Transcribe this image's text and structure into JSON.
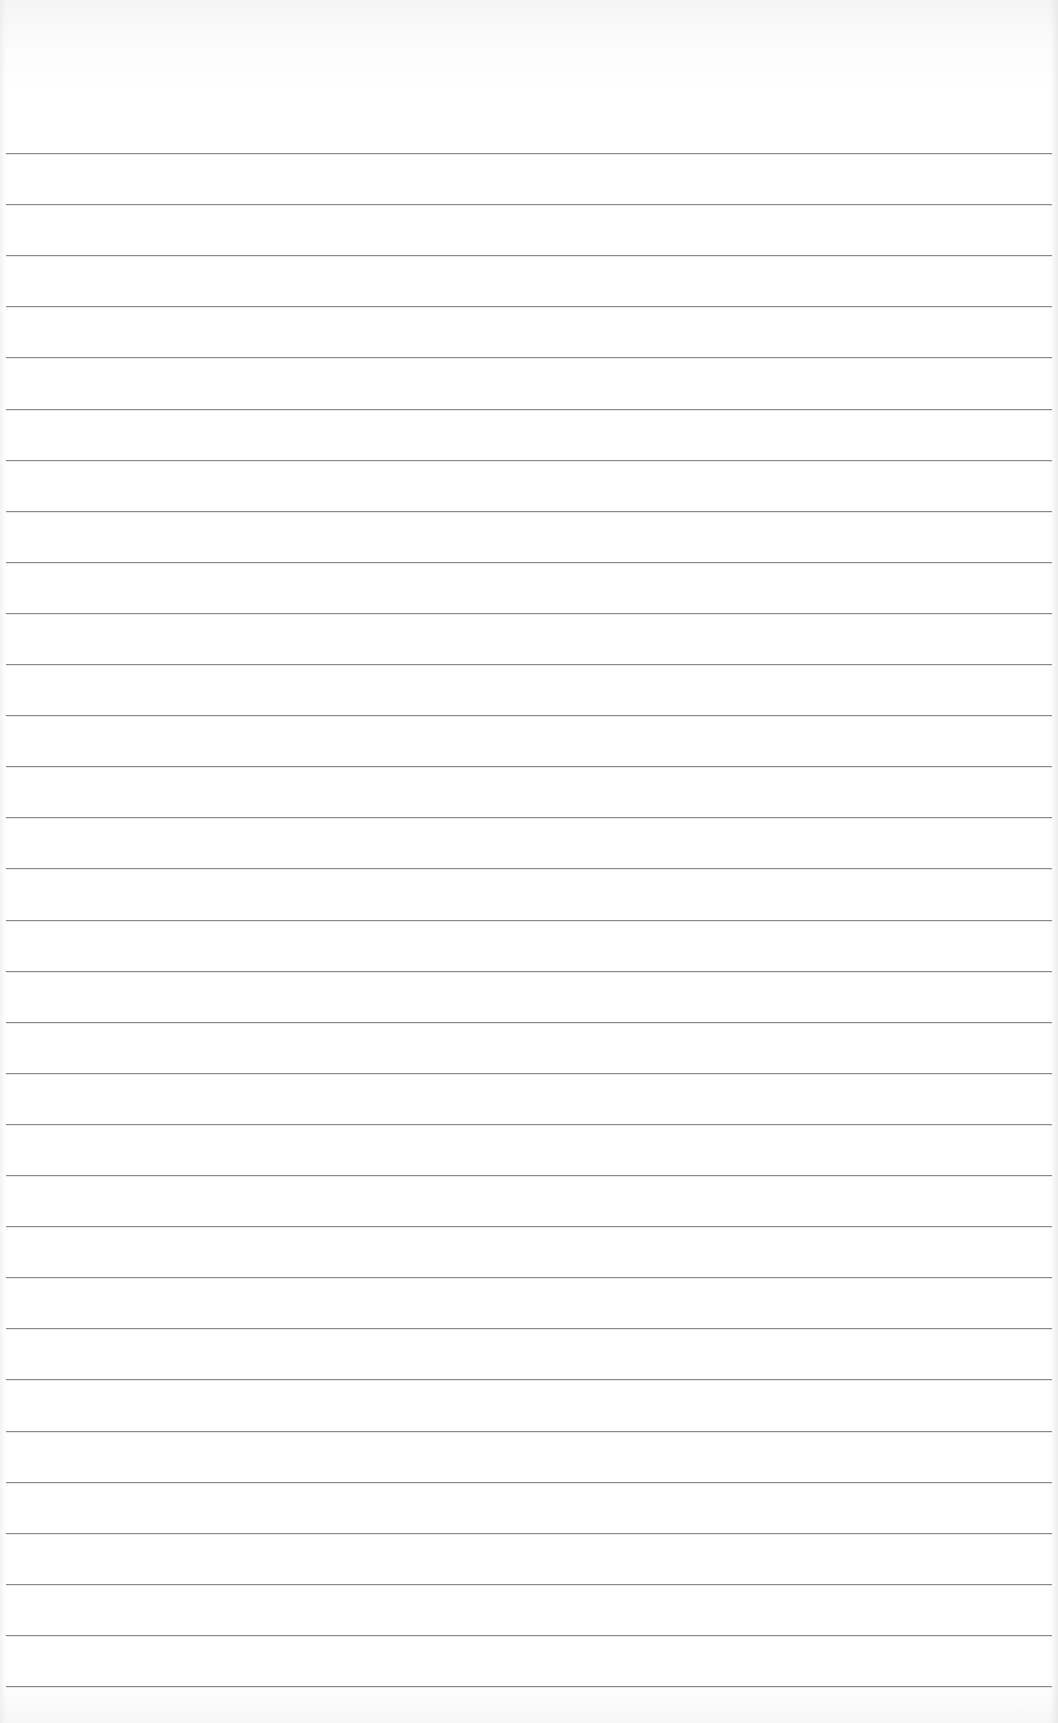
{
  "page": {
    "type": "blank lined paper",
    "background_color": "#ffffff",
    "rule_color": "#8a8a8a",
    "rule_count": 31,
    "first_rule_y": 153,
    "rule_spacing_px": 51.1
  }
}
